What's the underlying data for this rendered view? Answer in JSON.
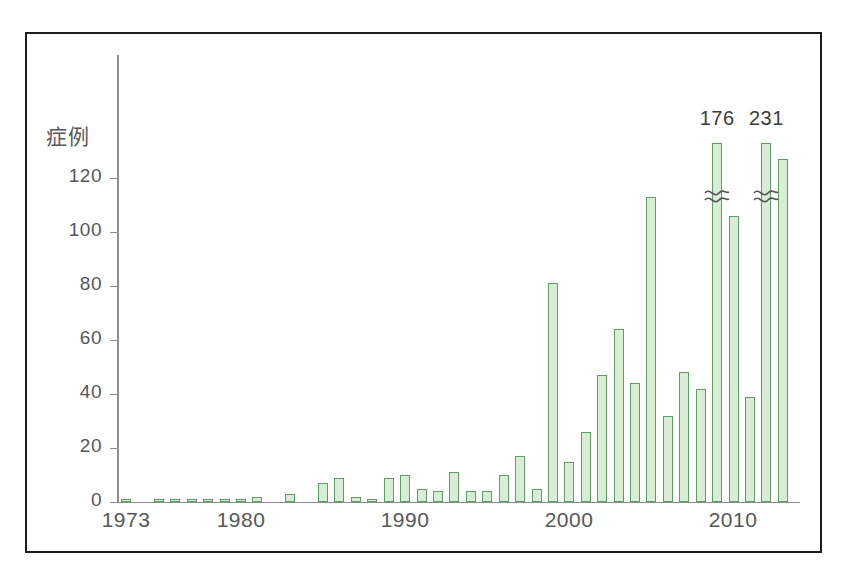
{
  "figure": {
    "frame_border_color": "#1c1c1c",
    "background_color": "#ffffff"
  },
  "axis": {
    "y_title": "症例",
    "y_ticks": [
      "0",
      "20",
      "40",
      "60",
      "80",
      "100",
      "120"
    ],
    "x_ticks": [
      "1973",
      "1980",
      "1990",
      "2000",
      "2010"
    ]
  },
  "annotations": [
    {
      "text": "176",
      "for_year": 2009
    },
    {
      "text": "231",
      "for_year": 2012
    }
  ],
  "colors": {
    "bar_fill": "#d9ecd6",
    "bar_stroke": "#5d9e64",
    "axis": "#8d8d8d",
    "text": "#55585a"
  },
  "chart_data": {
    "type": "bar",
    "title": "",
    "xlabel": "",
    "ylabel": "症例",
    "ylim": [
      0,
      135
    ],
    "grid": false,
    "legend": "none",
    "axis_break": {
      "present": true,
      "note": "Bars for 2009 (176) and 2012 (231) are truncated with a break mark and labelled with their true value.",
      "broken_years": [
        2009,
        2012
      ]
    },
    "categories": [
      1973,
      1974,
      1975,
      1976,
      1977,
      1978,
      1979,
      1980,
      1981,
      1982,
      1983,
      1984,
      1985,
      1986,
      1987,
      1988,
      1989,
      1990,
      1991,
      1992,
      1993,
      1994,
      1995,
      1996,
      1997,
      1998,
      1999,
      2000,
      2001,
      2002,
      2003,
      2004,
      2005,
      2006,
      2007,
      2008,
      2009,
      2010,
      2011,
      2012,
      2013
    ],
    "values": [
      1,
      0,
      1,
      1,
      1,
      1,
      1,
      1,
      2,
      0,
      3,
      0,
      7,
      9,
      2,
      1,
      9,
      10,
      5,
      4,
      11,
      4,
      4,
      10,
      17,
      5,
      81,
      15,
      26,
      47,
      64,
      44,
      113,
      32,
      48,
      42,
      176,
      106,
      39,
      231,
      127
    ],
    "value_labels_shown": {
      "2009": "176",
      "2012": "231"
    }
  }
}
